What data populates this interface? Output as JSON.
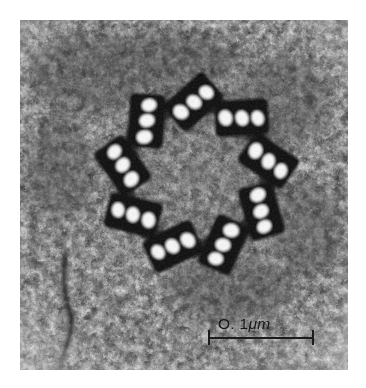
{
  "figure": {
    "kind": "transmission-electron-micrograph",
    "caption": "",
    "background_color": "#ffffff",
    "plate": {
      "left": 20,
      "top": 20,
      "width": 328,
      "height": 350,
      "tone_light": "#f4f4f4",
      "tone_mid": "#9a9a9a",
      "tone_dark": "#141414"
    }
  },
  "scale_bar": {
    "label": "O. 1",
    "unit": "μm",
    "full_text": "O. 1μm",
    "length_px": 106,
    "x": 208,
    "y": 316,
    "color": "#181818",
    "end_ticks": 2
  },
  "structure": {
    "name": "centriole",
    "symmetry": 9,
    "subunit": "microtubule triplet",
    "center_x": 176,
    "center_y": 156,
    "radius": 82,
    "triplet_angles_deg": [
      268,
      308,
      348,
      28,
      68,
      108,
      148,
      188,
      228
    ],
    "triplets": [
      {
        "index": 1,
        "angle": 268,
        "tilt": -42,
        "lumens": 3
      },
      {
        "index": 2,
        "angle": 308,
        "tilt": -42,
        "lumens": 3
      },
      {
        "index": 3,
        "angle": 348,
        "tilt": -42,
        "lumens": 3
      },
      {
        "index": 4,
        "angle": 28,
        "tilt": -42,
        "lumens": 3
      },
      {
        "index": 5,
        "angle": 68,
        "tilt": -42,
        "lumens": 3
      },
      {
        "index": 6,
        "angle": 108,
        "tilt": -42,
        "lumens": 3
      },
      {
        "index": 7,
        "angle": 148,
        "tilt": -42,
        "lumens": 3
      },
      {
        "index": 8,
        "angle": 188,
        "tilt": -42,
        "lumens": 3
      },
      {
        "index": 9,
        "angle": 228,
        "tilt": -42,
        "lumens": 3
      }
    ]
  },
  "features": {
    "cytoplasm_texture": "granular-stippled",
    "filament_streak": {
      "description": "vertical dark membrane filament at lower left",
      "x": 52,
      "y_top": 250,
      "y_bottom": 350
    }
  }
}
